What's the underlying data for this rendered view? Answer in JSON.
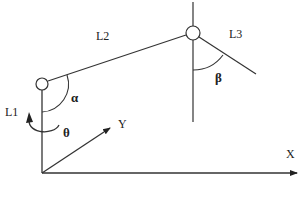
{
  "diagram": {
    "type": "robot-arm-kinematics",
    "stroke_color": "#222222",
    "background_color": "#ffffff",
    "labels": {
      "link1": "L1",
      "link2": "L2",
      "link3": "L3",
      "angle_alpha": "α",
      "angle_beta": "β",
      "angle_theta": "θ",
      "axis_x": "X",
      "axis_y": "Y"
    },
    "elements": {
      "origin": [
        42,
        173
      ],
      "joint_base": {
        "center": [
          42,
          84
        ],
        "r": 6
      },
      "joint_elbow": {
        "center": [
          193,
          33
        ],
        "r": 7
      },
      "x_axis_end": [
        298,
        173
      ],
      "y_axis_end": [
        110,
        128
      ],
      "l3_end": [
        256,
        74
      ]
    }
  }
}
